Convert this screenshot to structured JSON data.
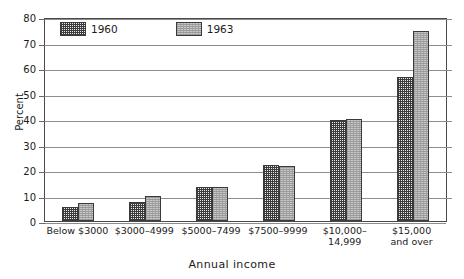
{
  "chart_data": {
    "type": "bar",
    "title": "",
    "xlabel": "Annual income",
    "ylabel": "Percent",
    "ylim": [
      0,
      80
    ],
    "yticks": [
      0,
      10,
      20,
      30,
      40,
      50,
      60,
      70,
      80
    ],
    "ytick_labels": [
      "0",
      "10",
      "20",
      "30",
      "40",
      "50",
      "60",
      "70",
      "80"
    ],
    "grid": "horizontal",
    "legend_position": "top-left-inside",
    "categories": [
      "Below $3000",
      "$3000–4999",
      "$5000–7499",
      "$7500–9999",
      "$10,000–14,999",
      "$15,000 and over"
    ],
    "category_lines": [
      [
        "Below $3000"
      ],
      [
        "$3000–4999"
      ],
      [
        "$5000–7499"
      ],
      [
        "$7500–9999"
      ],
      [
        "$10,000–14,999"
      ],
      [
        "$15,000",
        "and over"
      ]
    ],
    "series": [
      {
        "name": "1960",
        "pattern": "dark-checkerboard",
        "color": "#e9e9e9",
        "values": [
          5.5,
          7.5,
          13.5,
          22.0,
          39.5,
          56.5
        ]
      },
      {
        "name": "1963",
        "pattern": "light-speckle",
        "color": "#c9c9c9",
        "values": [
          7.0,
          10.0,
          13.5,
          21.5,
          40.0,
          74.5
        ]
      }
    ]
  },
  "legend": {
    "items": [
      {
        "label": "1960"
      },
      {
        "label": "1963"
      }
    ]
  },
  "colors": {
    "frame": "#4a4a4a",
    "gridline": "#8d8d8d",
    "text": "#1a1a1a"
  }
}
